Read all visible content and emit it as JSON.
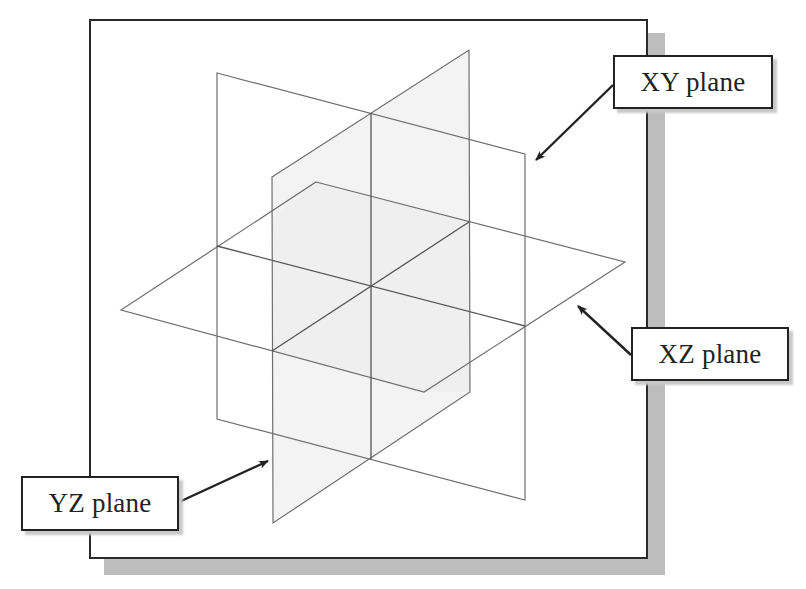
{
  "diagram": {
    "type": "3d-datum-planes",
    "labels": {
      "xy": "XY plane",
      "xz": "XZ plane",
      "yz": "YZ plane"
    },
    "colors": {
      "frame_border": "#2a2a2a",
      "frame_shadow": "#bdbdbd",
      "plane_edge": "#6e6e6e",
      "plane_fill": "#f2f2f2",
      "arrow": "#222222",
      "label_border": "#222222",
      "label_text": "#222222"
    },
    "planes": [
      {
        "name": "XY plane",
        "corners": [
          [
            217,
            73
          ],
          [
            525,
            154
          ],
          [
            525,
            500
          ],
          [
            217,
            419
          ]
        ]
      },
      {
        "name": "YZ plane",
        "corners": [
          [
            272,
            177
          ],
          [
            469,
            50
          ],
          [
            470,
            392
          ],
          [
            273,
            523
          ]
        ]
      },
      {
        "name": "XZ plane",
        "corners": [
          [
            316,
            182
          ],
          [
            625,
            262
          ],
          [
            424,
            392
          ],
          [
            121,
            310
          ]
        ]
      }
    ],
    "origin": [
      371,
      286
    ],
    "callouts": [
      {
        "label": "XY plane",
        "box": [
          613,
          55,
          160,
          54
        ],
        "arrow_from": [
          613,
          85
        ],
        "arrow_to": [
          534,
          162
        ]
      },
      {
        "label": "XZ plane",
        "box": [
          631,
          327,
          158,
          54
        ],
        "arrow_from": [
          631,
          355
        ],
        "arrow_to": [
          576,
          304
        ]
      },
      {
        "label": "YZ plane",
        "box": [
          21,
          476,
          158,
          55
        ],
        "arrow_from": [
          179,
          502
        ],
        "arrow_to": [
          270,
          460
        ]
      }
    ]
  }
}
